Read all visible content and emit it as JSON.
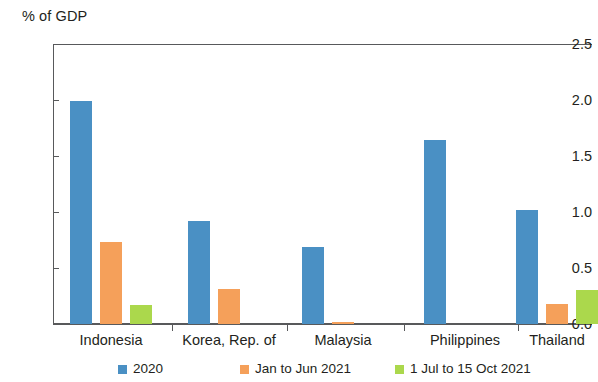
{
  "chart_data": {
    "type": "bar",
    "title": "",
    "subtitle": "",
    "xlabel": "",
    "ylabel": "% of GDP",
    "ylim": [
      0.0,
      2.5
    ],
    "yticks": [
      "0.0",
      "0.5",
      "1.0",
      "1.5",
      "2.0",
      "2.5"
    ],
    "ytick_values": [
      0.0,
      0.5,
      1.0,
      1.5,
      2.0,
      2.5
    ],
    "grid": false,
    "legend_position": "bottom",
    "categories": [
      "Indonesia",
      "Korea, Rep. of",
      "Malaysia",
      "Philippines",
      "Thailand"
    ],
    "series": [
      {
        "name": "2020",
        "color": "#4a90c4",
        "values": [
          1.99,
          0.92,
          0.69,
          1.64,
          1.02
        ]
      },
      {
        "name": "Jan to Jun 2021",
        "color": "#f5a05a",
        "values": [
          0.73,
          0.31,
          0.02,
          0.0,
          0.18
        ]
      },
      {
        "name": "1 Jul to 15 Oct 2021",
        "color": "#abd84c",
        "values": [
          0.17,
          0.0,
          0.0,
          0.0,
          0.3
        ]
      }
    ]
  },
  "axis": {
    "title": "% of GDP"
  },
  "legend": {
    "items": [
      {
        "label": "2020",
        "color": "#4a90c4"
      },
      {
        "label": "Jan to Jun 2021",
        "color": "#f5a05a"
      },
      {
        "label": "1 Jul to 15 Oct 2021",
        "color": "#abd84c"
      }
    ]
  },
  "colors": {
    "series_2020": "#4a90c4",
    "series_jan_jun_2021": "#f5a05a",
    "series_jul_oct_2021": "#abd84c",
    "axis": "#58595b",
    "text": "#231f20",
    "background": "#ffffff"
  }
}
